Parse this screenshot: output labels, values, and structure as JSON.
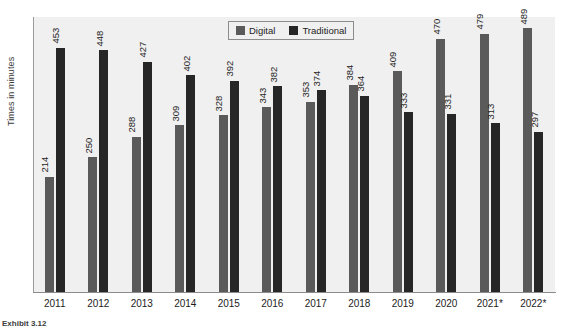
{
  "chart_data": {
    "type": "bar",
    "title": "",
    "xlabel": "",
    "ylabel": "Times in minutes",
    "categories": [
      "2011",
      "2012",
      "2013",
      "2014",
      "2015",
      "2016",
      "2017",
      "2018",
      "2019",
      "2020",
      "2021*",
      "2022*"
    ],
    "series": [
      {
        "name": "Digital",
        "color": "#5a5a5a",
        "values": [
          214,
          250,
          288,
          309,
          328,
          343,
          353,
          384,
          409,
          470,
          479,
          489
        ]
      },
      {
        "name": "Traditional",
        "color": "#262626",
        "values": [
          453,
          448,
          427,
          402,
          392,
          382,
          374,
          364,
          333,
          331,
          313,
          297
        ]
      }
    ],
    "ylim": [
      0,
      510
    ],
    "grid": false,
    "legend_position": "top-center",
    "data_labels": true
  },
  "legend": {
    "items": [
      {
        "label": "Digital",
        "swatch_name": "legend-swatch-digital"
      },
      {
        "label": "Traditional",
        "swatch_name": "legend-swatch-traditional"
      }
    ]
  },
  "caption": {
    "text": "Exhibit 3.12"
  }
}
